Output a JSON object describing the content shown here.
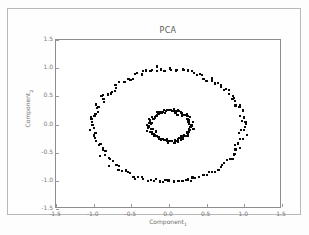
{
  "figure": {
    "caption": "",
    "border_color": "#b9b9b9"
  },
  "chart_data": {
    "type": "scatter",
    "title": "PCA",
    "xlabel": "Component",
    "xlabel_sub": "1",
    "ylabel": "Component",
    "ylabel_sub": "2",
    "xlim": [
      -1.5,
      1.5
    ],
    "ylim": [
      -1.5,
      1.5
    ],
    "grid": false,
    "legend": null,
    "marker_color": "#0a0a0a",
    "marker": "square",
    "xticks": [
      "-1.5",
      "-1.0",
      "-0.5",
      "0.0",
      "0.5",
      "1.0",
      "1.5"
    ],
    "xtick_values": [
      -1.5,
      -1.0,
      -0.5,
      0.0,
      0.5,
      1.0,
      1.5
    ],
    "yticks": [
      "1.5",
      "1.0",
      "0.5",
      "0.0",
      "-0.5",
      "-1.0",
      "-1.5"
    ],
    "ytick_values": [
      1.5,
      1.0,
      0.5,
      0.0,
      -0.5,
      -1.0,
      -1.5
    ],
    "series": [
      {
        "name": "outer-ring",
        "radius": 1.0,
        "radius_noise": 0.045,
        "center": [
          0.0,
          -0.02
        ],
        "n_points": 150
      },
      {
        "name": "inner-ring",
        "radius": 0.27,
        "radius_noise": 0.035,
        "center": [
          0.02,
          -0.02
        ],
        "n_points": 110
      }
    ]
  }
}
